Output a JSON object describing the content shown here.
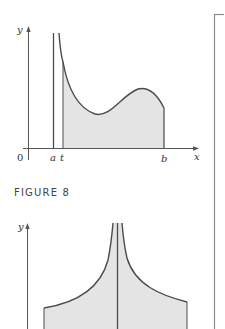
{
  "figure_top": {
    "axis_labels": {
      "y": "y",
      "x": "x",
      "origin": "0"
    },
    "tick_labels": {
      "a": "a",
      "t": "t",
      "b": "b"
    },
    "description": "Area under a curve with a vertical asymptote at x=a, shaded from x=t to x=b"
  },
  "caption": "FIGURE 8",
  "figure_bottom": {
    "axis_labels": {
      "y": "y"
    },
    "description": "Shaded region under a curve with a vertical asymptote in the middle, symmetric about the center line"
  },
  "colors": {
    "line": "#4a4a4a",
    "fill": "#e4e4e4",
    "axis": "#555555",
    "border": "#8a8a8a"
  }
}
